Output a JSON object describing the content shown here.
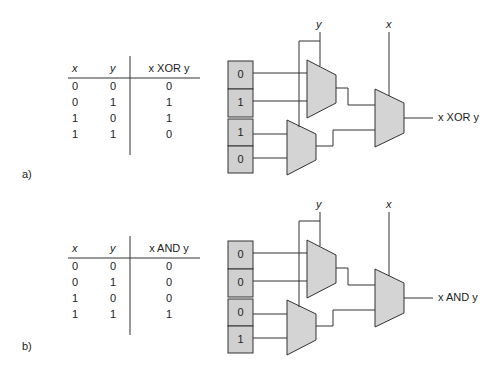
{
  "panels": [
    {
      "label": "a)",
      "operation": "XOR",
      "table": {
        "headers": [
          "x",
          "y",
          "x XOR y"
        ],
        "rows": [
          [
            "0",
            "0",
            "0"
          ],
          [
            "0",
            "1",
            "1"
          ],
          [
            "1",
            "0",
            "1"
          ],
          [
            "1",
            "1",
            "0"
          ]
        ]
      },
      "circuit": {
        "inputs_top_mux": [
          "0",
          "1"
        ],
        "inputs_bottom_mux": [
          "1",
          "0"
        ],
        "select_inner": "y",
        "select_outer": "x",
        "output_label": "x XOR y"
      }
    },
    {
      "label": "b)",
      "operation": "AND",
      "table": {
        "headers": [
          "x",
          "y",
          "x AND y"
        ],
        "rows": [
          [
            "0",
            "0",
            "0"
          ],
          [
            "0",
            "1",
            "0"
          ],
          [
            "1",
            "0",
            "0"
          ],
          [
            "1",
            "1",
            "1"
          ]
        ]
      },
      "circuit": {
        "inputs_top_mux": [
          "0",
          "0"
        ],
        "inputs_bottom_mux": [
          "0",
          "1"
        ],
        "select_inner": "y",
        "select_outer": "x",
        "output_label": "x AND y"
      }
    }
  ],
  "colors": {
    "mux_fill": "#d4d4d4",
    "box_fill": "#d0d0d0",
    "line": "#333333"
  }
}
